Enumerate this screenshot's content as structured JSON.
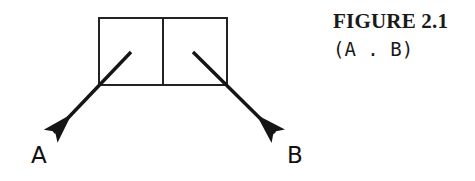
{
  "figure": {
    "caption_title": "FIGURE 2.1",
    "caption_sexp": "(A . B)",
    "background_color": "#ffffff",
    "ink_color": "#1a1a1a"
  },
  "diagram": {
    "type": "cons-cell-box-and-pointer",
    "cons_box": {
      "x": 99,
      "y": 18,
      "width": 128,
      "height": 67,
      "divider_x": 163,
      "stroke_width": 2,
      "stroke_color": "#222222",
      "cells": [
        {
          "name": "car-cell",
          "label": ""
        },
        {
          "name": "cdr-cell",
          "label": ""
        }
      ]
    },
    "pointers": [
      {
        "name": "car-pointer",
        "from_cell": "car-cell",
        "target_label": "A",
        "x1": 131,
        "y1": 52,
        "x2": 47,
        "y2": 140,
        "stroke_width": 3.4,
        "stroke_color": "#151515"
      },
      {
        "name": "cdr-pointer",
        "from_cell": "cdr-cell",
        "target_label": "B",
        "x1": 193,
        "y1": 52,
        "x2": 282,
        "y2": 140,
        "stroke_width": 3.4,
        "stroke_color": "#151515"
      }
    ],
    "labels": [
      {
        "name": "label-a",
        "text": "A",
        "x": 31,
        "y": 144
      },
      {
        "name": "label-b",
        "text": "B",
        "x": 287,
        "y": 144
      }
    ]
  }
}
